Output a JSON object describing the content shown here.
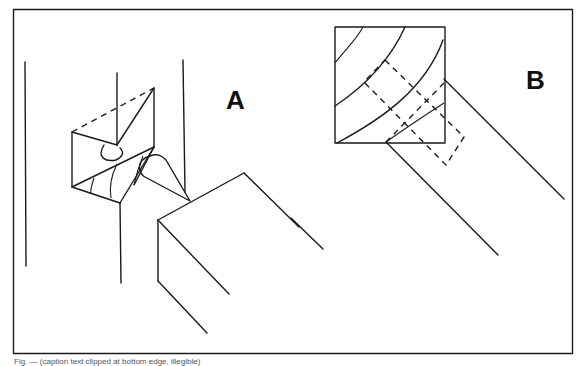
{
  "figure": {
    "labels": {
      "a": "A",
      "b": "B"
    },
    "caption": "Fig. — (caption text clipped at bottom edge, illegible)"
  },
  "colors": {
    "line": "#1a1a1a",
    "background": "#ffffff"
  }
}
